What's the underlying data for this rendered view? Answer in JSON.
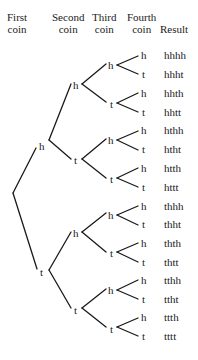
{
  "headers": {
    "first": [
      "First",
      "coin"
    ],
    "second": [
      "Second",
      "coin"
    ],
    "third": [
      "Third",
      "coin"
    ],
    "fourth": [
      "Fourth",
      "coin"
    ],
    "result": "Result"
  },
  "tree": {
    "first": [
      "h",
      "t"
    ],
    "second": [
      "h",
      "t",
      "h",
      "t"
    ],
    "third": [
      "h",
      "t",
      "h",
      "t",
      "h",
      "t",
      "h",
      "t"
    ],
    "fourth": [
      "h",
      "t",
      "h",
      "t",
      "h",
      "t",
      "h",
      "t",
      "h",
      "t",
      "h",
      "t",
      "h",
      "t",
      "h",
      "t"
    ]
  },
  "results": [
    "hhhh",
    "hhht",
    "hhth",
    "hhtt",
    "hthh",
    "htht",
    "htth",
    "httt",
    "thhh",
    "thht",
    "thth",
    "thtt",
    "tthh",
    "ttht",
    "ttth",
    "tttt"
  ]
}
